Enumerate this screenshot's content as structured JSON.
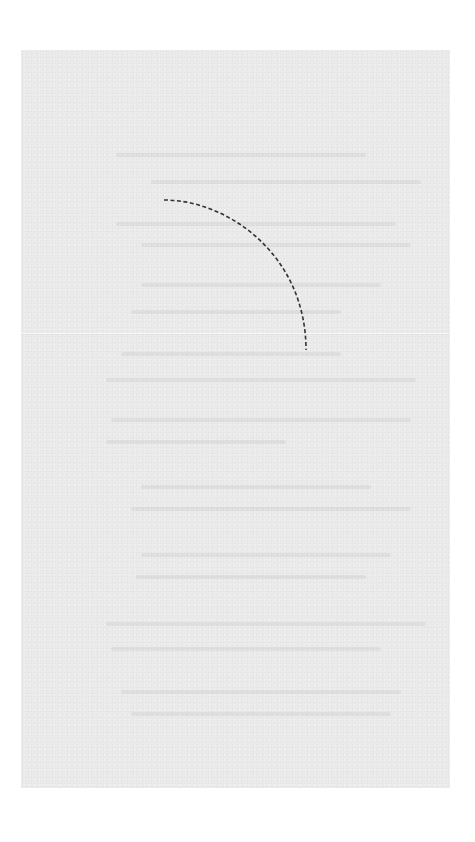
{
  "scene": {
    "description": "Scanned sheet of light gray paper with faint illegible bleed-through text and a dashed curved line",
    "paper_color": "#eaeaea",
    "background_color": "#ffffff",
    "arc": {
      "style": "dashed",
      "color": "#333333",
      "start": [
        164,
        200
      ],
      "end": [
        306,
        350
      ]
    },
    "crease_y": 283,
    "ghost_text_lines": [
      {
        "x": 95,
        "y": 103,
        "w": 250
      },
      {
        "x": 130,
        "y": 130,
        "w": 270
      },
      {
        "x": 95,
        "y": 172,
        "w": 280
      },
      {
        "x": 120,
        "y": 193,
        "w": 270
      },
      {
        "x": 120,
        "y": 233,
        "w": 240
      },
      {
        "x": 110,
        "y": 260,
        "w": 210
      },
      {
        "x": 100,
        "y": 302,
        "w": 220
      },
      {
        "x": 85,
        "y": 328,
        "w": 310
      },
      {
        "x": 90,
        "y": 368,
        "w": 300
      },
      {
        "x": 85,
        "y": 390,
        "w": 180
      },
      {
        "x": 120,
        "y": 435,
        "w": 230
      },
      {
        "x": 110,
        "y": 457,
        "w": 280
      },
      {
        "x": 120,
        "y": 503,
        "w": 250
      },
      {
        "x": 115,
        "y": 525,
        "w": 230
      },
      {
        "x": 85,
        "y": 572,
        "w": 320
      },
      {
        "x": 90,
        "y": 597,
        "w": 270
      },
      {
        "x": 100,
        "y": 640,
        "w": 280
      },
      {
        "x": 110,
        "y": 662,
        "w": 260
      }
    ]
  }
}
